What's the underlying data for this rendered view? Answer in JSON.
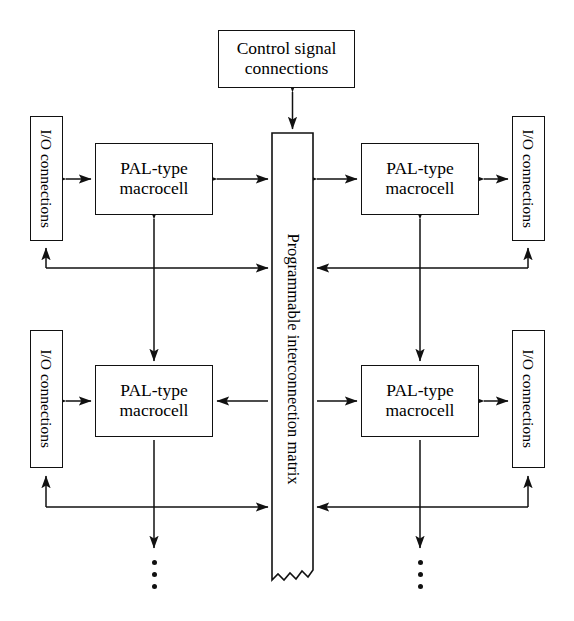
{
  "diagram": {
    "background": "#ffffff",
    "line_color": "#111111"
  },
  "blocks": {
    "control": {
      "label": "Control signal connections",
      "line1": "Control signal",
      "line2": "connections"
    },
    "matrix": {
      "label": "Programmable interconnection matrix"
    },
    "macrocells": [
      {
        "id": "top-left",
        "line1": "PAL-type",
        "line2": "macrocell"
      },
      {
        "id": "top-right",
        "line1": "PAL-type",
        "line2": "macrocell"
      },
      {
        "id": "bottom-left",
        "line1": "PAL-type",
        "line2": "macrocell"
      },
      {
        "id": "bottom-right",
        "line1": "PAL-type",
        "line2": "macrocell"
      }
    ],
    "io": [
      {
        "id": "top-left",
        "label": "I/O connections"
      },
      {
        "id": "top-right",
        "label": "I/O connections"
      },
      {
        "id": "bottom-left",
        "label": "I/O connections"
      },
      {
        "id": "bottom-right",
        "label": "I/O connections"
      }
    ]
  },
  "ellipsis": {
    "left": "⋮",
    "right": "⋮"
  }
}
